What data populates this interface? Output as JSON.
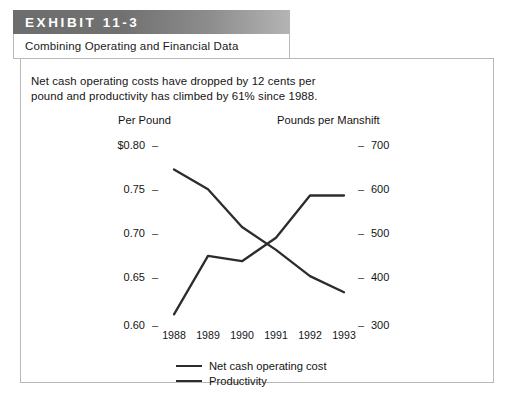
{
  "exhibit": {
    "tab_label": "EXHIBIT 11-3",
    "subtitle": "Combining Operating and Financial Data"
  },
  "caption": {
    "line1": "Net cash operating costs have dropped by 12 cents per",
    "line2": "pound and productivity has climbed by 61% since 1988."
  },
  "colors": {
    "line": "#2c2c2c",
    "border": "#b9b9b9",
    "header_dark": "#6d6d6d",
    "header_light": "#b4b4b4",
    "text": "#141414"
  },
  "chart_data": {
    "type": "line",
    "title": "Combining Operating and Financial Data",
    "xlabel": "",
    "ylabel": "Per Pound",
    "y2label": "Pounds per Manshift",
    "categories": [
      "1988",
      "1989",
      "1990",
      "1991",
      "1992",
      "1993"
    ],
    "x": [
      1988,
      1989,
      1990,
      1991,
      1992,
      1993
    ],
    "ylim": [
      0.6,
      0.8
    ],
    "y2lim": [
      300,
      700
    ],
    "yticks": [
      "$0.80",
      "0.75",
      "0.70",
      "0.65",
      "0.60"
    ],
    "ytick_values": [
      0.8,
      0.75,
      0.7,
      0.65,
      0.6
    ],
    "y2ticks": [
      "700",
      "600",
      "500",
      "400",
      "300"
    ],
    "y2tick_values": [
      700,
      600,
      500,
      400,
      300
    ],
    "grid": false,
    "legend_position": "bottom-center",
    "series": [
      {
        "name": "Net cash operating cost",
        "axis": "left",
        "units": "$ per pound",
        "values": [
          0.787,
          0.722,
          0.728,
          0.702,
          0.655,
          0.655
        ]
      },
      {
        "name": "Productivity",
        "axis": "right",
        "units": "pounds per manshift",
        "values": [
          352,
          396,
          480,
          531,
          589,
          625
        ]
      }
    ],
    "annotations": [
      "Net cash operating costs have dropped by 12 cents per pound and productivity has climbed by 61% since 1988."
    ]
  }
}
